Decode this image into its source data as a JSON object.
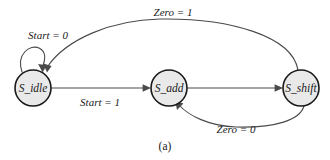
{
  "figure": {
    "caption": "(a)",
    "background_color": "#ffffff",
    "state_fill_color": "#e9e9e9",
    "state_stroke_color": "#1a1a1a",
    "edge_color": "#4a4a4a",
    "text_color": "#1a1a1a"
  },
  "diagram": {
    "type": "state-transition-diagram",
    "states": [
      {
        "id": "s_idle",
        "label": "S_idle",
        "cx": 33,
        "cy": 88,
        "r": 18
      },
      {
        "id": "s_add",
        "label": "S_add",
        "cx": 169,
        "cy": 88,
        "r": 18
      },
      {
        "id": "s_shift",
        "label": "S_shift",
        "cx": 301,
        "cy": 88,
        "r": 18
      }
    ],
    "transitions": [
      {
        "id": "t_idle_self",
        "from": "s_idle",
        "to": "s_idle",
        "label": "Start = 0",
        "label_x": 48,
        "label_y": 36,
        "shape": "self-loop-top"
      },
      {
        "id": "t_idle_add",
        "from": "s_idle",
        "to": "s_add",
        "label": "Start = 1",
        "label_x": 100,
        "label_y": 103,
        "shape": "straight"
      },
      {
        "id": "t_add_shift",
        "from": "s_add",
        "to": "s_shift",
        "label": "",
        "label_x": 235,
        "label_y": 103,
        "shape": "straight"
      },
      {
        "id": "t_shift_add",
        "from": "s_shift",
        "to": "s_add",
        "label": "Zero = 0",
        "label_x": 236,
        "label_y": 130,
        "shape": "arc-below"
      },
      {
        "id": "t_shift_idle",
        "from": "s_shift",
        "to": "s_idle",
        "label": "Zero = 1",
        "label_x": 173,
        "label_y": 13,
        "shape": "arc-above"
      }
    ]
  }
}
